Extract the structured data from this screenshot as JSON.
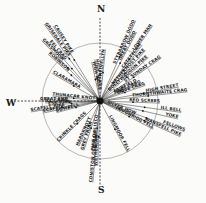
{
  "diagram": {
    "type": "radial compass diagram of fell directions",
    "center": {
      "x": 100,
      "y": 101
    },
    "circle_radius": 58,
    "cardinals": [
      {
        "label": "N",
        "x": 97,
        "y": 12
      },
      {
        "label": "S",
        "x": 98,
        "y": 193
      },
      {
        "label": "W",
        "x": 6,
        "y": 106
      }
    ],
    "rays": [
      {
        "label": "CAUSEY PIKE",
        "angle": -122,
        "len": 88
      },
      {
        "label": "GRISEDALE PIKE",
        "angle": -126,
        "len": 95
      },
      {
        "label": "EEL CRAG",
        "angle": -131,
        "len": 78
      },
      {
        "label": "GRASMOOR",
        "angle": -134,
        "len": 84
      },
      {
        "label": "ROBINSON",
        "angle": -138,
        "len": 70
      },
      {
        "label": "CLARAMARA",
        "angle": -150,
        "len": 55
      },
      {
        "label": "HIGH RAISE",
        "angle": -102,
        "len": 40
      },
      {
        "label": "HIGH SEAT",
        "angle": -97,
        "len": 42
      },
      {
        "label": "HELVELLYN",
        "angle": -84,
        "len": 52
      },
      {
        "label": "STYBARROW DODD",
        "angle": -66,
        "len": 88
      },
      {
        "label": "GREAT DODD",
        "angle": -62,
        "len": 78
      },
      {
        "label": "LOWER MAN",
        "angle": -55,
        "len": 92
      },
      {
        "label": "CATSTYCAM",
        "angle": -53,
        "len": 70
      },
      {
        "label": "NETHERMOST PIKE",
        "angle": -48,
        "len": 68
      },
      {
        "label": "DOLLYWAGGON PIKE",
        "angle": -42,
        "len": 65
      },
      {
        "label": "ST SUNDAY CRAG",
        "angle": -35,
        "len": 75
      },
      {
        "label": "FAIRFIELD",
        "angle": -27,
        "len": 42
      },
      {
        "label": "HART CRAG",
        "angle": -23,
        "len": 45
      },
      {
        "label": "DOVE CRAG",
        "angle": -19,
        "len": 48
      },
      {
        "label": "HIGH STREET",
        "angle": -10,
        "len": 80
      },
      {
        "label": "THORNTHWAITE CRAG",
        "angle": -6,
        "len": 88
      },
      {
        "label": "RED SCREES",
        "angle": 2,
        "len": 60
      },
      {
        "label": "ILL BELL",
        "angle": 8,
        "len": 82
      },
      {
        "label": "YOKE",
        "angle": 13,
        "len": 80
      },
      {
        "label": "WANSFELL PIKE",
        "angle": 24,
        "len": 88
      },
      {
        "label": "LOUGHRIGG FELL",
        "angle": 28,
        "len": 60
      },
      {
        "label": "SILVER HOW",
        "angle": 22,
        "len": 38
      },
      {
        "label": "FELLOWS",
        "angle": 20,
        "len": 90
      },
      {
        "label": "LINGMOOR FELL",
        "angle": 62,
        "len": 58
      },
      {
        "label": "PIKE O'BLISCO",
        "angle": 96,
        "len": 50
      },
      {
        "label": "WETHERLAM",
        "angle": 92,
        "len": 65
      },
      {
        "label": "CONISTON OLD MAN",
        "angle": 95,
        "len": 82
      },
      {
        "label": "GREY FRIAR",
        "angle": 108,
        "len": 52
      },
      {
        "label": "HARDKNOTT",
        "angle": 115,
        "len": 50
      },
      {
        "label": "CRINKLE CRAGS",
        "angle": 135,
        "len": 58
      },
      {
        "label": "BOWFELL",
        "angle": 165,
        "len": 45
      },
      {
        "label": "SCAFELL",
        "angle": 168,
        "len": 58
      },
      {
        "label": "SCAFELL PIKE",
        "angle": 171,
        "len": 70
      },
      {
        "label": "ESK PIKE",
        "angle": 175,
        "len": 52
      },
      {
        "label": "GREAT END",
        "angle": 180,
        "len": 60
      },
      {
        "label": "THUNACAR KNOTT",
        "angle": 186,
        "len": 48
      },
      {
        "label": "ILL CRAG",
        "angle": 178,
        "len": 55
      }
    ]
  }
}
